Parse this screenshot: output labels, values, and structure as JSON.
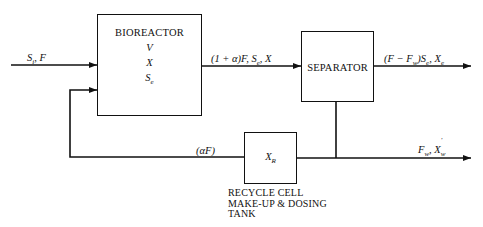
{
  "diagram": {
    "blocks": {
      "bioreactor": {
        "title": "BIOREACTOR",
        "vars": [
          "V",
          "X",
          "S_e"
        ],
        "var_display": [
          "V",
          "X",
          "Se"
        ]
      },
      "separator": {
        "title": "SEPARATOR"
      },
      "recycle": {
        "var": "X_R",
        "var_main": "X",
        "var_sub": "R",
        "caption": [
          "RECYCLE CELL",
          "MAKE-UP & DOSING",
          "TANK"
        ]
      }
    },
    "streams": {
      "feed": {
        "label": "S_i, F",
        "main1": "S",
        "sub1": "i",
        "rest": ", F"
      },
      "reactor_out": {
        "label": "(1 + α)F, S_e, X",
        "pre": "(1 + α)F, S",
        "sub": "e",
        "post": ", X"
      },
      "effluent": {
        "label": "(F − F_w)S_e, X_e",
        "p1": "(F − F",
        "s1": "w",
        "p2": ")S",
        "s2": "e",
        "p3": ", X",
        "s3": "e"
      },
      "waste": {
        "label": "F_w, X'_w",
        "p1": "F",
        "s1": "w",
        "p2": ", X",
        "sup": "'",
        "s2": "w"
      },
      "recycle": {
        "label": "(αF)"
      }
    },
    "colors": {
      "line": "#111111",
      "background": "#ffffff"
    }
  }
}
